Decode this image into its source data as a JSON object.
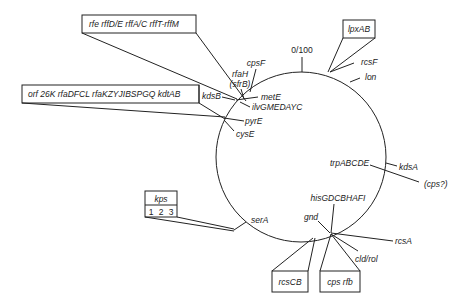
{
  "diagram": {
    "type": "circular genetic map",
    "origin_label": "0/100",
    "boxes": {
      "rfe_cluster": "rfe  rffD/E  rffA/C  rffT-rffM",
      "rfa_cluster": "orf 26K  rfaDFCL  rfaKZYJIBSPGQ  kdtAB",
      "lpx": "lpxAB",
      "kps_title": "kps",
      "kps_1": "1",
      "kps_2": "2",
      "kps_3": "3",
      "rcsCB": "rcsCB",
      "cps_rfb": "cps  rfb"
    },
    "genes": {
      "rfaH": "rfaH",
      "sfrB": "(sfrB)",
      "cpsF": "cpsF",
      "kdsB": "kdsB",
      "metE": "metE",
      "ilv": "ilvGMEDAYC",
      "pyrE": "pyrE",
      "cysE": "cysE",
      "rcsF": "rcsF",
      "lon": "lon",
      "trp": "trpABCDE",
      "kdsA": "kdsA",
      "cps_q": "(cps?)",
      "serA": "serA",
      "his": "hisGDCBHAFI",
      "gnd": "gnd",
      "rcsA": "rcsA",
      "cld": "cld/rol"
    }
  }
}
